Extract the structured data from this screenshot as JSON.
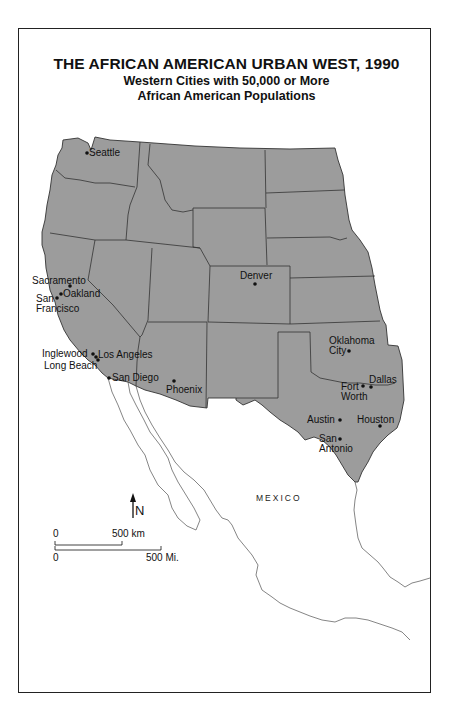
{
  "title": "THE AFRICAN AMERICAN URBAN WEST, 1990",
  "subtitle_line1": "Western Cities with 50,000 or More",
  "subtitle_line2": "African American Populations",
  "colors": {
    "land_fill": "#9c9c9c",
    "border": "#333333",
    "background": "#ffffff",
    "mexico_outline": "#777777"
  },
  "cities": [
    {
      "name": "Seattle",
      "label": "Seattle"
    },
    {
      "name": "Sacramento",
      "label": "Sacramento"
    },
    {
      "name": "Oakland",
      "label": "Oakland"
    },
    {
      "name": "San Francisco",
      "label_line1": "San",
      "label_line2": "Francisco"
    },
    {
      "name": "Denver",
      "label": "Denver"
    },
    {
      "name": "Inglewood",
      "label": "Inglewood"
    },
    {
      "name": "Los Angeles",
      "label": "Los Angeles"
    },
    {
      "name": "Long Beach",
      "label": "Long Beach"
    },
    {
      "name": "San Diego",
      "label": "San Diego"
    },
    {
      "name": "Phoenix",
      "label": "Phoenix"
    },
    {
      "name": "Oklahoma City",
      "label_line1": "Oklahoma",
      "label_line2": "City"
    },
    {
      "name": "Fort Worth",
      "label_line1": "Fort",
      "label_line2": "Worth"
    },
    {
      "name": "Dallas",
      "label": "Dallas"
    },
    {
      "name": "Austin",
      "label": "Austin"
    },
    {
      "name": "Houston",
      "label": "Houston"
    },
    {
      "name": "San Antonio",
      "label_line1": "San",
      "label_line2": "Antonio"
    }
  ],
  "country_label": "MEXICO",
  "north_arrow": {
    "label": "N"
  },
  "scale": {
    "km_start": "0",
    "km_end": "500 km",
    "mi_start": "0",
    "mi_end": "500 Mi."
  }
}
